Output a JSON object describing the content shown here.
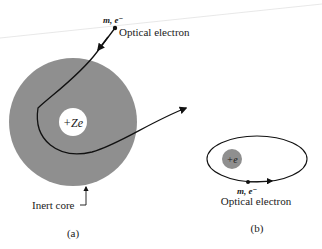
{
  "figure_a": {
    "nucleus_label": "+Ze",
    "electron_label": "m, e⁻",
    "electron_caption": "Optical electron",
    "core_label": "Inert core",
    "panel_label": "(a)"
  },
  "figure_b": {
    "nucleus_label": "+e",
    "electron_label": "m, e⁻",
    "electron_caption": "Optical electron",
    "panel_label": "(b)"
  },
  "colors": {
    "core": "#8f8f8f",
    "line": "#111111",
    "background": "#ffffff"
  }
}
